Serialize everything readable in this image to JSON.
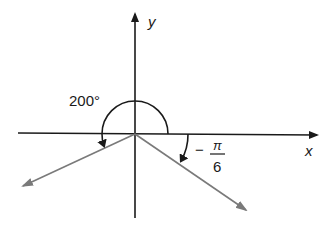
{
  "diagram": {
    "type": "angle-diagram",
    "axes": {
      "x_label": "x",
      "y_label": "y"
    },
    "angles": [
      {
        "name": "positive-angle",
        "label": "200°",
        "value_degrees": 200,
        "direction": "counterclockwise"
      },
      {
        "name": "negative-angle",
        "label_sign": "−",
        "label_numerator": "π",
        "label_denominator": "6",
        "value_radians": "-π/6",
        "direction": "clockwise"
      }
    ],
    "colors": {
      "axis": "#1a1a1a",
      "ray": "#7a7a7a",
      "arc": "#1a1a1a"
    }
  }
}
